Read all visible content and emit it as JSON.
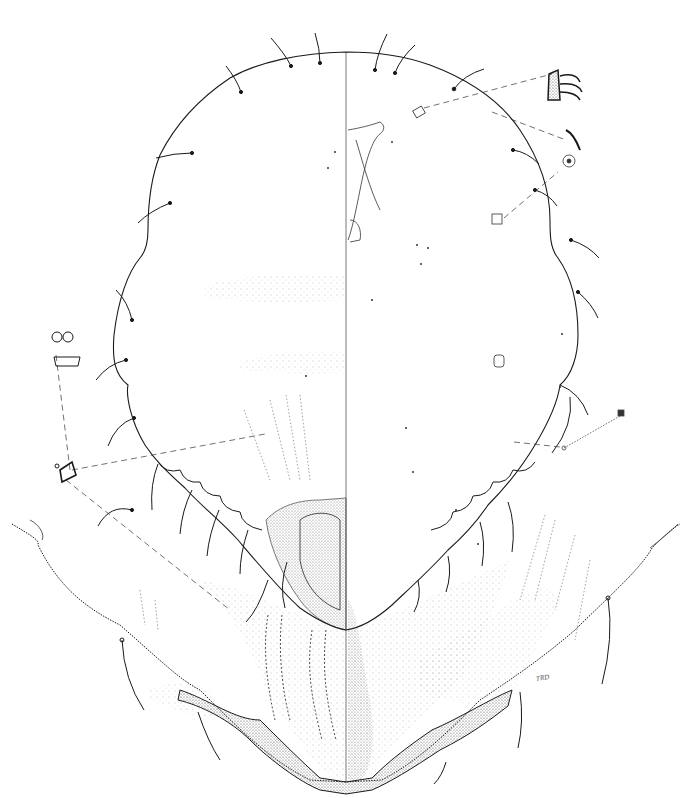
{
  "figure": {
    "signature": "TRD",
    "colors": {
      "ink": "#1a1a1a",
      "stipple": "#666666",
      "background": "#ffffff"
    }
  }
}
